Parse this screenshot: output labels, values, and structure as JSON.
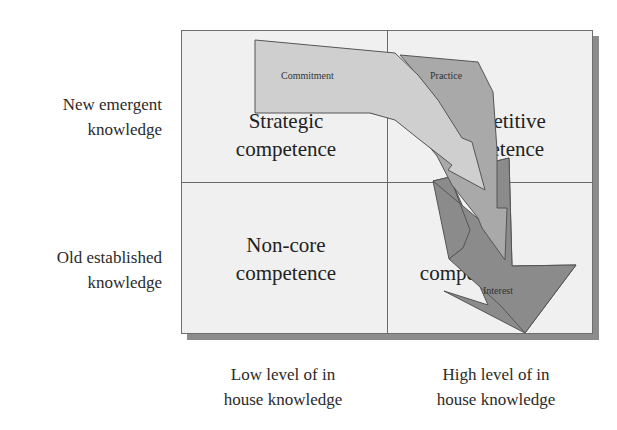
{
  "row_labels": [
    {
      "line1": "New emergent",
      "line2": "knowledge"
    },
    {
      "line1": "Old established",
      "line2": "knowledge"
    }
  ],
  "column_labels": [
    {
      "line1": "Low level of in",
      "line2": "house knowledge"
    },
    {
      "line1": "High level of in",
      "line2": "house knowledge"
    }
  ],
  "quadrants": {
    "top_left": {
      "line1": "Strategic",
      "line2": "competence",
      "visible_line1": "St"
    },
    "top_right": {
      "line1": "Competitive",
      "line2": "competence",
      "visible_line1": "etitive",
      "visible_line2": "tence"
    },
    "bottom_left": {
      "line1": "Non-core",
      "line2": "competence"
    },
    "bottom_right": {
      "line1": "Core",
      "line2": "competence",
      "visible_line1": "com"
    }
  },
  "arrows": [
    {
      "label": "Commitment",
      "color": "#cfcfcf"
    },
    {
      "label": "Practice",
      "color": "#a9a9a9"
    },
    {
      "label": "Interest",
      "color": "#8b8b8b"
    }
  ],
  "colors": {
    "grid_fill": "#f0f0f0",
    "grid_border": "#6e6e6e",
    "shadow": "#8c8c8c"
  }
}
